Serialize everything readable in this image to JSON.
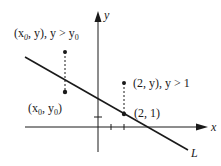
{
  "diagram": {
    "axes": {
      "x_label": "x",
      "y_label": "y"
    },
    "line": {
      "label": "L"
    },
    "points": [
      {
        "id": "x0-y",
        "label_parts": [
          "(x",
          "0",
          ", y), y > y",
          "0"
        ]
      },
      {
        "id": "x0-y0",
        "label_parts": [
          "(x",
          "0",
          ", y",
          "0",
          ")"
        ]
      },
      {
        "id": "2-y",
        "label": "(2, y), y > 1"
      },
      {
        "id": "2-1",
        "label": "(2, 1)"
      }
    ],
    "colors": {
      "ink": "#1a1a1a",
      "background": "#ffffff"
    }
  }
}
